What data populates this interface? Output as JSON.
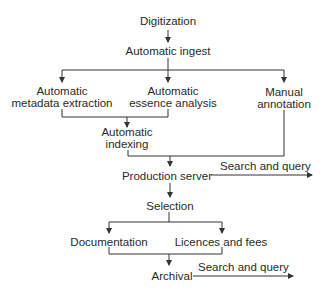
{
  "diagram": {
    "type": "flowchart",
    "nodes": {
      "digitization": "Digitization",
      "automatic_ingest": "Automatic ingest",
      "metadata_extraction": {
        "line1": "Automatic",
        "line2": "metadata extraction"
      },
      "essence_analysis": {
        "line1": "Automatic",
        "line2": "essence analysis"
      },
      "manual_annotation": {
        "line1": "Manual",
        "line2": "annotation"
      },
      "automatic_indexing": {
        "line1": "Automatic",
        "line2": "indexing"
      },
      "production_server": "Production server",
      "selection": "Selection",
      "documentation": "Documentation",
      "licences_fees": "Licences and fees",
      "archival": "Archival"
    },
    "edge_labels": {
      "production_search": "Search and query",
      "archival_search": "Search and query"
    },
    "edges": [
      [
        "Digitization",
        "Automatic ingest"
      ],
      [
        "Automatic ingest",
        "Automatic metadata extraction"
      ],
      [
        "Automatic ingest",
        "Automatic essence analysis"
      ],
      [
        "Automatic ingest",
        "Manual annotation"
      ],
      [
        "Automatic metadata extraction",
        "Automatic indexing"
      ],
      [
        "Automatic essence analysis",
        "Automatic indexing"
      ],
      [
        "Automatic indexing",
        "Production server"
      ],
      [
        "Manual annotation",
        "Production server"
      ],
      [
        "Production server",
        "Search and query"
      ],
      [
        "Production server",
        "Selection"
      ],
      [
        "Selection",
        "Documentation"
      ],
      [
        "Selection",
        "Licences and fees"
      ],
      [
        "Documentation",
        "Archival"
      ],
      [
        "Licences and fees",
        "Archival"
      ],
      [
        "Archival",
        "Search and query"
      ]
    ],
    "line_color": "#333333"
  }
}
